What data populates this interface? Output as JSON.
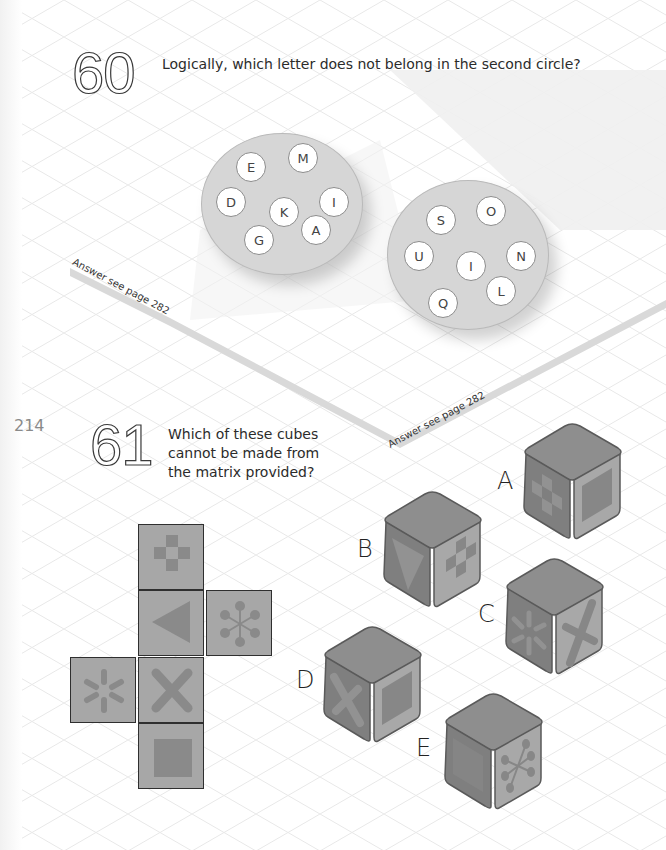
{
  "page": {
    "page_number": "214"
  },
  "puzzle_60": {
    "number": "60",
    "question": "Logically, which letter does not belong in the second circle?",
    "answer_ref": "Answer see page 282",
    "circle_1": {
      "letters": [
        "E",
        "M",
        "D",
        "K",
        "I",
        "G",
        "A"
      ]
    },
    "circle_2": {
      "letters": [
        "S",
        "O",
        "U",
        "I",
        "N",
        "Q",
        "L"
      ]
    }
  },
  "puzzle_61": {
    "number": "61",
    "question_lines": [
      "Which of these cubes",
      "cannot be made from",
      "the matrix provided?"
    ],
    "answer_ref": "Answer see page 282",
    "net": {
      "faces": [
        {
          "position": "top",
          "symbol": "checker-cross"
        },
        {
          "position": "middle",
          "symbol": "triangle-left"
        },
        {
          "position": "right",
          "symbol": "molecule-star"
        },
        {
          "position": "left",
          "symbol": "asterisk"
        },
        {
          "position": "center-lower",
          "symbol": "x-cross"
        },
        {
          "position": "bottom",
          "symbol": "square"
        }
      ]
    },
    "cubes": [
      {
        "label": "A",
        "left_face": "checker-cross",
        "right_face": "square"
      },
      {
        "label": "B",
        "left_face": "triangle-down",
        "right_face": "checker-cross"
      },
      {
        "label": "C",
        "left_face": "asterisk",
        "right_face": "x-cross"
      },
      {
        "label": "D",
        "left_face": "x-cross",
        "right_face": "square"
      },
      {
        "label": "E",
        "left_face": "square",
        "right_face": "molecule-star"
      }
    ]
  },
  "colors": {
    "face_fill": "#a7a7a7",
    "symbol_fill": "#8a8a8a",
    "cube_top": "#8e8e8e",
    "cube_left": "#7e7e7e",
    "cube_right": "#a9a9a9",
    "circle_fill": "#d6d6d6",
    "grid_line": "#e6e6e6"
  }
}
